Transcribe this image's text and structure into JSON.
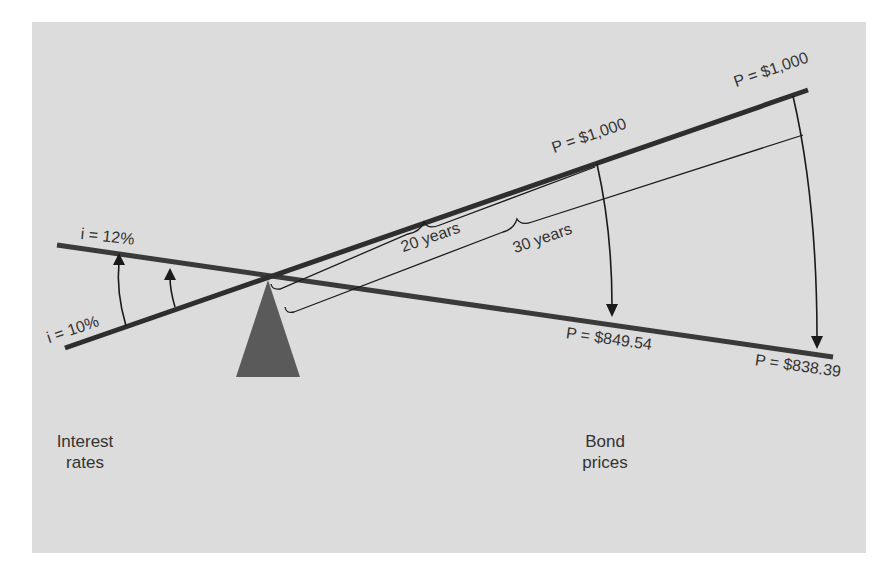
{
  "diagram": {
    "colors": {
      "background": "#dcdcdc",
      "line": "#3a3a3a",
      "fulcrum": "#5a5a5a",
      "text": "#333333"
    },
    "rate_labels": {
      "high": "i = 12%",
      "low": "i = 10%"
    },
    "price_labels": {
      "par_20": "P = $1,000",
      "par_30": "P = $1,000",
      "new_20": "P = $849.54",
      "new_30": "P = $838.39"
    },
    "maturity_labels": {
      "short": "20 years",
      "long": "30 years"
    },
    "axis_labels": {
      "left_line1": "Interest",
      "left_line2": "rates",
      "right_line1": "Bond",
      "right_line2": "prices"
    }
  }
}
